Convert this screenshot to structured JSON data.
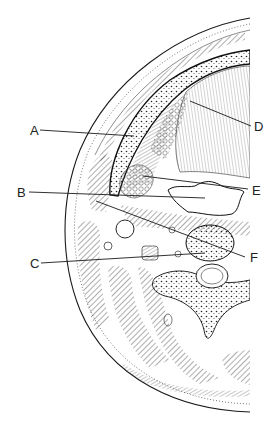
{
  "figure": {
    "ink_color": "#1a1a1a",
    "background": "#ffffff"
  },
  "labels": [
    {
      "id": "A",
      "text": "A",
      "x": 30,
      "y": 124,
      "line": [
        40,
        130,
        134,
        136
      ]
    },
    {
      "id": "B",
      "text": "B",
      "x": 17,
      "y": 186,
      "line": [
        29,
        192,
        205,
        198
      ]
    },
    {
      "id": "C",
      "text": "C",
      "x": 30,
      "y": 257,
      "line": [
        41,
        263,
        205,
        253
      ]
    },
    {
      "id": "D",
      "text": "D",
      "x": 255,
      "y": 120,
      "line": [
        190,
        101,
        251,
        126
      ]
    },
    {
      "id": "E",
      "text": "E",
      "x": 253,
      "y": 184,
      "line": [
        143,
        176,
        248,
        189
      ]
    },
    {
      "id": "F",
      "text": "F",
      "x": 251,
      "y": 251,
      "line": [
        96,
        201,
        245,
        257
      ]
    }
  ]
}
